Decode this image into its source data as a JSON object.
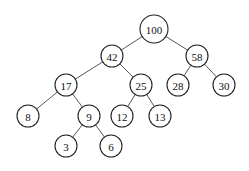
{
  "diagram": {
    "type": "binary-tree",
    "nodes": [
      {
        "id": "n100",
        "label": "100",
        "x": 154,
        "y": 29,
        "r": 14
      },
      {
        "id": "n42",
        "label": "42",
        "x": 112,
        "y": 56,
        "r": 11
      },
      {
        "id": "n58",
        "label": "58",
        "x": 197,
        "y": 56,
        "r": 11
      },
      {
        "id": "n17",
        "label": "17",
        "x": 66,
        "y": 85,
        "r": 11
      },
      {
        "id": "n25",
        "label": "25",
        "x": 141,
        "y": 85,
        "r": 11
      },
      {
        "id": "n28",
        "label": "28",
        "x": 178,
        "y": 85,
        "r": 11
      },
      {
        "id": "n30",
        "label": "30",
        "x": 224,
        "y": 85,
        "r": 11
      },
      {
        "id": "n8",
        "label": "8",
        "x": 28,
        "y": 116,
        "r": 11
      },
      {
        "id": "n9",
        "label": "9",
        "x": 89,
        "y": 116,
        "r": 11
      },
      {
        "id": "n12",
        "label": "12",
        "x": 122,
        "y": 116,
        "r": 11
      },
      {
        "id": "n13",
        "label": "13",
        "x": 160,
        "y": 116,
        "r": 11
      },
      {
        "id": "n3",
        "label": "3",
        "x": 66,
        "y": 146,
        "r": 11
      },
      {
        "id": "n6",
        "label": "6",
        "x": 111,
        "y": 146,
        "r": 11
      }
    ],
    "edges": [
      [
        "n100",
        "n42"
      ],
      [
        "n100",
        "n58"
      ],
      [
        "n42",
        "n17"
      ],
      [
        "n42",
        "n25"
      ],
      [
        "n58",
        "n28"
      ],
      [
        "n58",
        "n30"
      ],
      [
        "n17",
        "n8"
      ],
      [
        "n17",
        "n9"
      ],
      [
        "n25",
        "n12"
      ],
      [
        "n25",
        "n13"
      ],
      [
        "n9",
        "n3"
      ],
      [
        "n9",
        "n6"
      ]
    ]
  }
}
